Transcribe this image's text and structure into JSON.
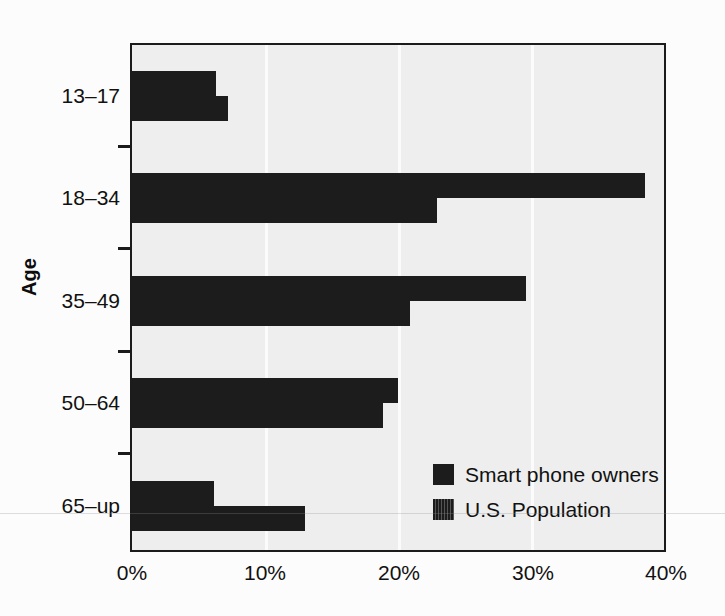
{
  "chart_data": {
    "type": "bar",
    "orientation": "horizontal",
    "title": "",
    "xlabel": "",
    "ylabel": "Age",
    "categories": [
      "13–17",
      "18–34",
      "35–49",
      "50–64",
      "65–up"
    ],
    "series": [
      {
        "name": "Smart phone owners",
        "values": [
          6.3,
          38.6,
          29.6,
          20.0,
          6.2
        ]
      },
      {
        "name": "U.S. Population",
        "values": [
          7.2,
          22.9,
          20.9,
          18.9,
          13.0
        ]
      }
    ],
    "xlim": [
      0,
      40
    ],
    "xticks": [
      0,
      10,
      20,
      30,
      40
    ],
    "xticklabels": [
      "0%",
      "10%",
      "20%",
      "30%",
      "40%"
    ],
    "grid": true,
    "legend_position": "inside-bottom-right",
    "colors": {
      "bar": "#1c1c1c",
      "plot_background": "#eeeeee",
      "frame": "#1b1b1b",
      "gridline": "#fbfbfb"
    }
  },
  "axis": {
    "y_title": "Age",
    "x_tick_labels": [
      "0%",
      "10%",
      "20%",
      "30%",
      "40%"
    ],
    "y_tick_labels": [
      "13–17",
      "18–34",
      "35–49",
      "50–64",
      "65–up"
    ]
  },
  "legend": {
    "items": [
      {
        "label": "Smart phone owners",
        "swatch": "solid-black-square"
      },
      {
        "label": "U.S. Population",
        "swatch": "hatched-black-square"
      }
    ]
  }
}
